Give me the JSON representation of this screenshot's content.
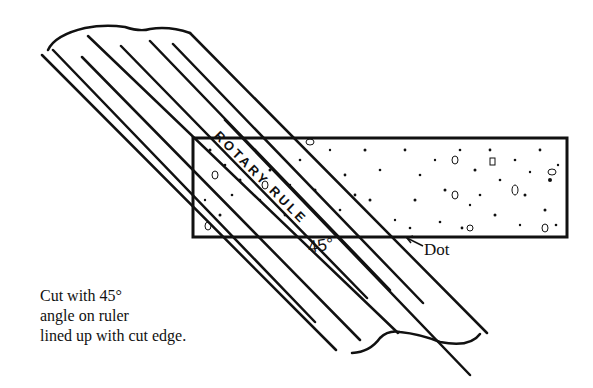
{
  "diagram": {
    "ruler": {
      "label": "ROTARY RULE",
      "orientation_deg": 45
    },
    "fabric_strip": {
      "x": 193,
      "y": 138,
      "width": 374,
      "height": 99,
      "pattern": "speckled"
    },
    "annotations": {
      "angle": "45°",
      "dot": "Dot"
    },
    "caption": {
      "lines": [
        "Cut with 45°",
        "angle on ruler",
        "lined up with cut edge."
      ]
    },
    "colors": {
      "ink": "#111111",
      "background": "#ffffff"
    }
  }
}
